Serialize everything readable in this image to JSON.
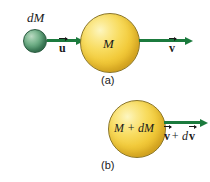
{
  "figure": {
    "panels": [
      {
        "id": "a",
        "caption": "(a)",
        "small_body_label": "dM",
        "small_body_velocity": "u",
        "large_body_label": "M",
        "large_body_velocity": "v"
      },
      {
        "id": "b",
        "caption": "(b)",
        "body_label": "M + dM",
        "body_velocity_prefix": "v",
        "body_velocity_suffix": "+ d",
        "body_velocity_tail": "v"
      }
    ]
  },
  "colors": {
    "arrow_green": "#1b7a3d",
    "sphere_yellow_light": "#fdf6c0",
    "sphere_yellow_dark": "#cf9a1b",
    "sphere_green_light": "#bcd9c3",
    "sphere_green_dark": "#2f6a49",
    "text": "#1a1a1a",
    "background": "#ffffff"
  }
}
